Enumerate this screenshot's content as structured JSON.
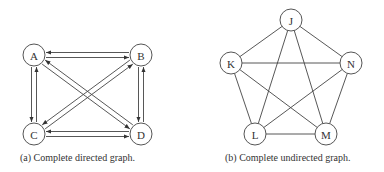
{
  "directed": {
    "caption": "(a)  Complete directed graph.",
    "nodes": [
      {
        "id": "A",
        "x": 34,
        "y": 55
      },
      {
        "id": "B",
        "x": 141,
        "y": 55
      },
      {
        "id": "C",
        "x": 34,
        "y": 134
      },
      {
        "id": "D",
        "x": 141,
        "y": 134
      }
    ],
    "edges": [
      [
        "A",
        "B"
      ],
      [
        "B",
        "A"
      ],
      [
        "A",
        "C"
      ],
      [
        "C",
        "A"
      ],
      [
        "A",
        "D"
      ],
      [
        "D",
        "A"
      ],
      [
        "B",
        "C"
      ],
      [
        "C",
        "B"
      ],
      [
        "B",
        "D"
      ],
      [
        "D",
        "B"
      ],
      [
        "C",
        "D"
      ],
      [
        "D",
        "C"
      ]
    ]
  },
  "undirected": {
    "caption": "(b)  Complete undirected graph.",
    "nodes": [
      {
        "id": "J",
        "x": 291,
        "y": 20
      },
      {
        "id": "K",
        "x": 231,
        "y": 63
      },
      {
        "id": "N",
        "x": 351,
        "y": 63
      },
      {
        "id": "L",
        "x": 255,
        "y": 134
      },
      {
        "id": "M",
        "x": 326,
        "y": 134
      }
    ],
    "edges": [
      [
        "J",
        "K"
      ],
      [
        "J",
        "N"
      ],
      [
        "J",
        "L"
      ],
      [
        "J",
        "M"
      ],
      [
        "K",
        "N"
      ],
      [
        "K",
        "L"
      ],
      [
        "K",
        "M"
      ],
      [
        "N",
        "L"
      ],
      [
        "N",
        "M"
      ],
      [
        "L",
        "M"
      ]
    ]
  }
}
